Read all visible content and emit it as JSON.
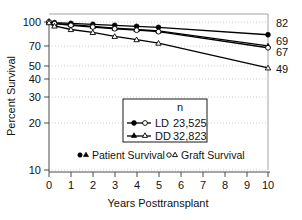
{
  "chart_data": {
    "type": "line",
    "title": "",
    "xlabel": "Years Posttransplant",
    "ylabel": "Percent Survival",
    "xlim": [
      0,
      10
    ],
    "ylim": [
      10,
      100
    ],
    "yscale": "log",
    "grid": true,
    "xticks": [
      "0",
      "1",
      "2",
      "3",
      "4",
      "5",
      "6",
      "7",
      "8",
      "9",
      "10"
    ],
    "yticks": [
      "100",
      "70",
      "50",
      "40",
      "30",
      "20",
      "10"
    ],
    "x": [
      0,
      0.25,
      1,
      2,
      3,
      4,
      5,
      10
    ],
    "series": [
      {
        "name": "LD Patient Survival",
        "marker": "filled-circle",
        "values": [
          100,
          99,
          98,
          96.5,
          95,
          93.5,
          92,
          82
        ],
        "end_label": "82"
      },
      {
        "name": "DD Patient Survival",
        "marker": "filled-triangle",
        "values": [
          100,
          98,
          96,
          93.5,
          91,
          89,
          87,
          69
        ],
        "end_label": "69"
      },
      {
        "name": "LD Graft Survival",
        "marker": "open-circle",
        "values": [
          100,
          97.5,
          95,
          92.5,
          90,
          88,
          86,
          67
        ],
        "end_label": "67"
      },
      {
        "name": "DD Graft Survival",
        "marker": "open-triangle",
        "values": [
          99,
          94,
          89,
          85,
          80,
          76,
          72,
          49
        ],
        "end_label": "49"
      }
    ],
    "end_labels": [
      "82",
      "69",
      "67",
      "49"
    ],
    "legend": {
      "position": "center",
      "header": "n",
      "rows": [
        {
          "label": "LD",
          "n": "23,525",
          "markers": "filled-circle open-circle"
        },
        {
          "label": "DD",
          "n": "32,823",
          "markers": "filled-triangle open-triangle"
        }
      ]
    },
    "annotations": [
      {
        "markers": "filled-circle filled-triangle",
        "text": "Patient Survival"
      },
      {
        "markers": "open-circle open-triangle",
        "text": "Graft Survival"
      }
    ]
  },
  "colors": {
    "line": "#000000",
    "grid": "#b9b9b9",
    "axis": "#4a4a4a",
    "background": "#ffffff"
  }
}
